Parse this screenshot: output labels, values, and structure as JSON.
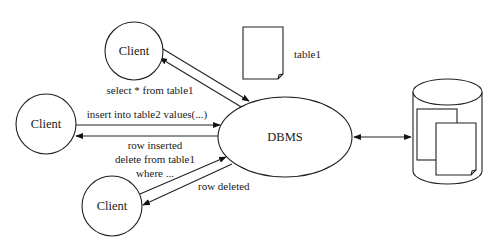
{
  "diagram": {
    "type": "client-server-database",
    "nodes": {
      "client_top": {
        "label": "Client",
        "shape": "circle"
      },
      "client_left": {
        "label": "Client",
        "shape": "circle"
      },
      "client_bottom": {
        "label": "Client",
        "shape": "circle"
      },
      "dbms": {
        "label": "DBMS",
        "shape": "ellipse"
      },
      "table_doc": {
        "label": "table1",
        "shape": "document"
      },
      "database": {
        "label": "",
        "shape": "cylinder",
        "contents": "two documents"
      }
    },
    "edges": {
      "top_request": {
        "from": "client_top",
        "to": "dbms",
        "label": "select * from table1"
      },
      "top_response": {
        "from": "dbms",
        "to": "client_top",
        "label": ""
      },
      "left_request": {
        "from": "client_left",
        "to": "dbms",
        "label": "insert into table2 values(...)"
      },
      "left_response": {
        "from": "dbms",
        "to": "client_left",
        "label": "row inserted"
      },
      "bottom_request": {
        "from": "client_bottom",
        "to": "dbms",
        "label_line1": "delete from table1",
        "label_line2": "where ..."
      },
      "bottom_response": {
        "from": "dbms",
        "to": "client_bottom",
        "label": "row deleted"
      },
      "dbms_storage": {
        "from": "dbms",
        "to": "database",
        "bidirectional": true,
        "label": ""
      }
    },
    "colors": {
      "stroke": "#222222",
      "fill": "#ffffff",
      "text": "#1a1a1a"
    }
  }
}
